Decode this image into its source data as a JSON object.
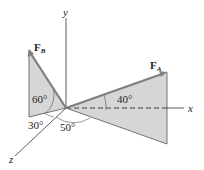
{
  "axes": {
    "x_label": "x",
    "y_label": "y",
    "z_label": "z"
  },
  "forces": [
    {
      "name": "F",
      "subscript": "B",
      "angles": {
        "from_vertical": "60°",
        "in_plane": "30°"
      }
    },
    {
      "name": "F",
      "subscript": "A",
      "angles": {
        "from_horizontal": "40°",
        "in_plane": "50°"
      }
    }
  ],
  "angle_labels": {
    "fb_60": "60°",
    "fb_30": "30°",
    "fa_40": "40°",
    "fa_50": "50°"
  },
  "colors": {
    "plane_fill": "#d6d6d6",
    "force_arrow": "#808080",
    "axis": "#333333"
  }
}
